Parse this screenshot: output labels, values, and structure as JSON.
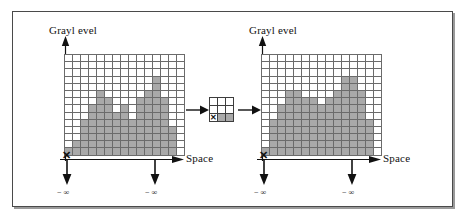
{
  "figure": {
    "title": "",
    "kind": "grayscale morphology dilation diagram",
    "colors": {
      "cell_fill": "#a9a9a9",
      "cell_empty": "#ffffff",
      "grid_line": "#6b6b6b",
      "ink": "#111111",
      "frame": "#4a4a4a",
      "shadow": "#9a9a9a",
      "page": "#ffffff"
    }
  },
  "labels": {
    "grayl   evel": "Grayl evel",
    "grayleveldup": "Grayl evel"
  },
  "left_panel": {
    "y_axis_label": "Grayl evel",
    "x_axis_label": "Space",
    "y_neg_inf_label": "− ∞",
    "x_neg_inf_label": "− ∞",
    "origin_marker": "✕",
    "grid": {
      "cols": 15,
      "rows": 14,
      "heights": [
        1,
        2,
        5,
        7,
        9,
        8,
        6,
        7,
        5,
        8,
        9,
        11,
        8,
        4,
        0
      ]
    }
  },
  "structuring_element": {
    "cols": 3,
    "rows": 3,
    "origin_marker": "✕",
    "filled_cells": [
      [
        2,
        1
      ],
      [
        2,
        2
      ]
    ],
    "origin_cell": [
      2,
      0
    ]
  },
  "right_panel": {
    "y_axis_label": "Grayl evel",
    "x_axis_label": "Space",
    "y_neg_inf_label": "− ∞",
    "x_neg_inf_label": "− ∞",
    "origin_marker": "✕",
    "grid": {
      "cols": 15,
      "rows": 14,
      "heights": [
        1,
        5,
        7,
        9,
        9,
        8,
        8,
        7,
        8,
        9,
        11,
        11,
        9,
        5,
        0
      ]
    }
  },
  "arrows": {
    "left_to_se": "arrow-right",
    "se_to_right": "arrow-right"
  },
  "chart_data": {
    "type": "bar",
    "xlabel": "Space",
    "ylabel": "Grayl evel",
    "categories": [
      "1",
      "2",
      "3",
      "4",
      "5",
      "6",
      "7",
      "8",
      "9",
      "10",
      "11",
      "12",
      "13",
      "14",
      "15"
    ],
    "ylim": [
      0,
      14
    ],
    "grid": true,
    "legend": "none",
    "series": [
      {
        "name": "Input signal (left)",
        "values": [
          1,
          2,
          5,
          7,
          9,
          8,
          6,
          7,
          5,
          8,
          9,
          11,
          8,
          4,
          0
        ]
      },
      {
        "name": "Dilated signal (right)",
        "values": [
          1,
          5,
          7,
          9,
          9,
          8,
          8,
          7,
          8,
          9,
          11,
          11,
          9,
          5,
          0
        ]
      }
    ],
    "annotations": [
      "− ∞",
      "− ∞",
      "Space",
      "Grayl evel"
    ]
  }
}
